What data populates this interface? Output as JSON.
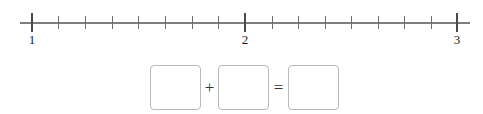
{
  "worksheet": {
    "width": 483,
    "height": 114,
    "background_color": "#ffffff"
  },
  "number_line": {
    "axis_color": "#7d7d7d",
    "tick_color": "#6f6f6f",
    "major_tick_color": "#4a4a4a",
    "label_color": "#1d1d1d",
    "start_value": 1,
    "end_value": 3,
    "divisions_per_unit": 8,
    "axis_left_px": 20,
    "axis_right_px": 470,
    "axis_y_px": 22,
    "major_ticks": [
      {
        "label": "1",
        "value": 1,
        "x_px": 32
      },
      {
        "label": "2",
        "value": 2,
        "x_px": 245
      },
      {
        "label": "3",
        "value": 3,
        "x_px": 457
      }
    ],
    "minor_tick_positions_px": [
      58,
      85,
      112,
      138,
      165,
      192,
      218,
      272,
      298,
      325,
      351,
      378,
      404,
      431
    ],
    "major_tick_top_px": 13,
    "major_tick_height_px": 19,
    "minor_tick_top_px": 16,
    "minor_tick_height_px": 13,
    "label_y_px": 33
  },
  "equation": {
    "border_color": "#b9b9b9",
    "operator_color": "#333333",
    "boxes": [
      {
        "name": "addend-1",
        "value": "",
        "x_px": 150,
        "y_px": 7,
        "w_px": 51,
        "h_px": 45
      },
      {
        "name": "addend-2",
        "value": "",
        "x_px": 218,
        "y_px": 7,
        "w_px": 51,
        "h_px": 45
      },
      {
        "name": "sum",
        "value": "",
        "x_px": 288,
        "y_px": 7,
        "w_px": 51,
        "h_px": 45
      }
    ],
    "operators": [
      {
        "name": "plus",
        "symbol": "+",
        "x_px": 201,
        "y_px": 20,
        "w_px": 17
      },
      {
        "name": "equals",
        "symbol": "=",
        "x_px": 269,
        "y_px": 20,
        "w_px": 19
      }
    ]
  }
}
